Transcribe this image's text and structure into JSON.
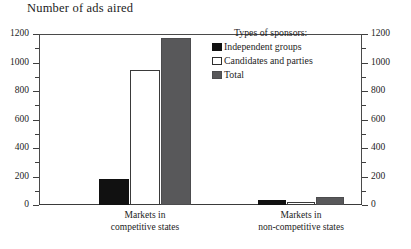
{
  "chart_data": {
    "type": "bar",
    "title": "Number of ads aired",
    "xlabel": "",
    "ylabel": "",
    "ylim": [
      0,
      1200
    ],
    "grid": false,
    "legend_position": "top-right",
    "legend_title": "Types of sponsors:",
    "categories": [
      "Markets in competitive states",
      "Markets in non-competitive states"
    ],
    "category_lines": [
      [
        "Markets in",
        "competitive states"
      ],
      [
        "Markets in",
        "non-competitive states"
      ]
    ],
    "series": [
      {
        "name": "Independent groups",
        "color": "#111111",
        "values": [
          180,
          35
        ]
      },
      {
        "name": "Candidates and parties",
        "color": "#ffffff",
        "values": [
          950,
          22
        ]
      },
      {
        "name": "Total",
        "color": "#58585a",
        "values": [
          1175,
          57
        ]
      }
    ],
    "axis_ticks": {
      "major": [
        0,
        200,
        400,
        600,
        800,
        1000,
        1200
      ],
      "minor": [
        100,
        300,
        500,
        700,
        900,
        1100
      ],
      "left_labels": [
        "0",
        "200",
        "400",
        "600",
        "800",
        "1000",
        "1200"
      ],
      "right_labels": [
        "0",
        "200",
        "400",
        "600",
        "800",
        "1000",
        "1200"
      ]
    }
  }
}
